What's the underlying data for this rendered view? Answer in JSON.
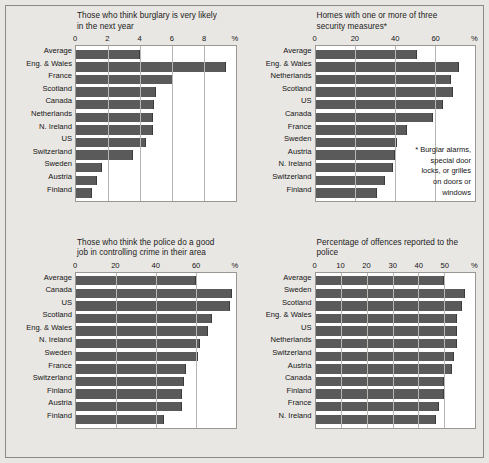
{
  "figure": {
    "background_color": "#e9e7e3",
    "bar_color": "#5a5a5a",
    "plot_background": "#ffffff",
    "percent_symbol": "%"
  },
  "chart_data": [
    {
      "id": "burglary-likely",
      "type": "bar",
      "orientation": "horizontal",
      "title": "Those who think burglary is very likely in the next year",
      "title_lines": [
        "Those who think burglary is very likely",
        "in the next year"
      ],
      "xlabel": "%",
      "ylabel": "",
      "xlim": [
        0,
        10
      ],
      "ticks": [
        0,
        2,
        4,
        6,
        8
      ],
      "tick_labels": [
        "0",
        "2",
        "4",
        "6",
        "8"
      ],
      "grid": true,
      "categories": [
        "Average",
        "Eng. & Wales",
        "France",
        "Scotland",
        "Canada",
        "Netherlands",
        "N. Ireland",
        "US",
        "Switzerland",
        "Sweden",
        "Austria",
        "Finland"
      ],
      "values": [
        4.0,
        9.4,
        6.1,
        5.0,
        4.9,
        4.8,
        4.8,
        4.4,
        3.6,
        1.6,
        1.3,
        1.0
      ]
    },
    {
      "id": "home-security",
      "type": "bar",
      "orientation": "horizontal",
      "title": "Homes with one or more of three security measures*",
      "title_lines": [
        "Homes with one or more of three",
        "security measures*"
      ],
      "xlabel": "%",
      "ylabel": "",
      "xlim": [
        0,
        80
      ],
      "ticks": [
        0,
        20,
        40,
        60
      ],
      "tick_labels": [
        "0",
        "20",
        "40",
        "60"
      ],
      "grid": true,
      "footnote": "* Burglar alarms, special door locks, or grilles on doors or windows",
      "footnote_lines": [
        "* Burglar alarms,",
        "special door",
        "locks, or grilles",
        "on doors or",
        "windows"
      ],
      "categories": [
        "Average",
        "Eng. & Wales",
        "Netherlands",
        "Scotland",
        "US",
        "Canada",
        "France",
        "Sweden",
        "Austria",
        "N. Ireland",
        "Switzerland",
        "Finland"
      ],
      "values": [
        51,
        72,
        68,
        69,
        64,
        59,
        46,
        41,
        40,
        39,
        35,
        31
      ]
    },
    {
      "id": "police-good-job",
      "type": "bar",
      "orientation": "horizontal",
      "title": "Those who think the police do a good job in controlling crime in their area",
      "title_lines": [
        "Those who think the police do a good",
        "job in controlling crime in their area"
      ],
      "xlabel": "%",
      "ylabel": "",
      "xlim": [
        0,
        80
      ],
      "ticks": [
        0,
        20,
        40,
        60
      ],
      "tick_labels": [
        "0",
        "20",
        "40",
        "60"
      ],
      "grid": true,
      "categories": [
        "Average",
        "Canada",
        "US",
        "Scotland",
        "Eng. & Wales",
        "N. Ireland",
        "Sweden",
        "France",
        "Switzerland",
        "Finland",
        "Austria",
        "Finland"
      ],
      "values": [
        60,
        78,
        77,
        68,
        66,
        62,
        61,
        55,
        54,
        53,
        53,
        44
      ]
    },
    {
      "id": "offences-reported",
      "type": "bar",
      "orientation": "horizontal",
      "title": "Percentage of offences reported to the police",
      "title_lines": [
        "Percentage of offences reported to the",
        "police"
      ],
      "xlabel": "%",
      "ylabel": "",
      "xlim": [
        0,
        62
      ],
      "ticks": [
        0,
        10,
        20,
        30,
        40,
        50
      ],
      "tick_labels": [
        "0",
        "10",
        "20",
        "30",
        "40",
        "50"
      ],
      "grid": true,
      "categories": [
        "Average",
        "Sweden",
        "Scotland",
        "Eng. & Wales",
        "US",
        "Netherlands",
        "Switzerland",
        "Austria",
        "Canada",
        "Finland",
        "France",
        "N. Ireland"
      ],
      "values": [
        50,
        58,
        57,
        55,
        55,
        55,
        54,
        53,
        50,
        50,
        48,
        47
      ]
    }
  ]
}
